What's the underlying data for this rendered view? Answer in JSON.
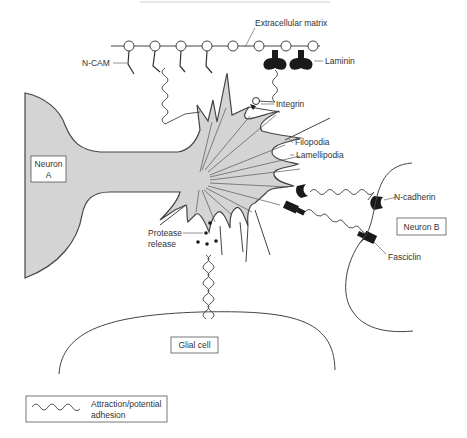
{
  "diagram": {
    "labels": {
      "extracellular_matrix": "Extracellular matrix",
      "ncam": "N-CAM",
      "laminin": "Laminin",
      "integrin": "Integrin",
      "filopodia": "Filopodia",
      "lamellipodia": "Lamellipodia",
      "n_cadherin": "N-cadherin",
      "fasciclin": "Fasciclin",
      "protease_line1": "Protease",
      "protease_line2": "release"
    },
    "boxes": {
      "neuron_a_line1": "Neuron",
      "neuron_a_line2": "A",
      "neuron_b": "Neuron B",
      "glial_cell": "Glial cell"
    },
    "legend": {
      "line1": "Attraction/potential",
      "line2": "adhesion"
    },
    "colors": {
      "cell_fill": "#d4d4d4",
      "stroke": "#444444",
      "molecule": "#1a1a1a"
    }
  }
}
